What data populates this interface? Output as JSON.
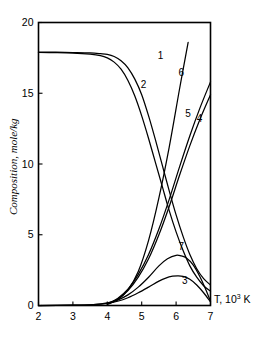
{
  "chart_data": {
    "type": "line",
    "title": "",
    "xlabel": "T, 10^3 K",
    "xlabel_main": "T, 10",
    "xlabel_sup": "3",
    "xlabel_tail": " K",
    "ylabel": "Composition, mole/kg",
    "xlim": [
      2,
      7
    ],
    "ylim": [
      0,
      20
    ],
    "xticks": [
      "2",
      "3",
      "4",
      "5",
      "6",
      "7"
    ],
    "xtick_values": [
      2,
      3,
      4,
      5,
      6,
      7
    ],
    "yticks": [
      "0",
      "5",
      "10",
      "15",
      "20"
    ],
    "ytick_values": [
      0,
      5,
      10,
      15,
      20
    ],
    "grid": false,
    "legend": "inline-curve-numbers",
    "line_color": "#000000",
    "background": "#ffffff",
    "series": [
      {
        "name": "1",
        "label": "1",
        "label_x": 5.55,
        "label_y": 17.45,
        "x": [
          2.0,
          2.5,
          3.0,
          3.5,
          3.8,
          4.0,
          4.2,
          4.4,
          4.6,
          4.8,
          5.0,
          5.2,
          5.4,
          5.6,
          5.8,
          6.0,
          6.2,
          6.4,
          6.6,
          6.8,
          7.0
        ],
        "y": [
          17.9,
          17.9,
          17.88,
          17.85,
          17.8,
          17.75,
          17.6,
          17.3,
          16.8,
          16.0,
          14.9,
          13.4,
          11.7,
          9.9,
          8.1,
          6.4,
          4.9,
          3.6,
          2.6,
          1.9,
          1.45
        ]
      },
      {
        "name": "2",
        "label": "2",
        "label_x": 5.05,
        "label_y": 15.35,
        "x": [
          2.0,
          2.5,
          3.0,
          3.5,
          3.8,
          4.0,
          4.2,
          4.4,
          4.6,
          4.8,
          5.0,
          5.2,
          5.4,
          5.6,
          5.8,
          6.0,
          6.2,
          6.4,
          6.6,
          6.8,
          7.0
        ],
        "y": [
          17.88,
          17.87,
          17.84,
          17.76,
          17.66,
          17.5,
          17.2,
          16.7,
          15.9,
          14.8,
          13.4,
          11.8,
          10.1,
          8.4,
          6.7,
          5.2,
          3.9,
          2.8,
          2.0,
          1.4,
          1.0
        ]
      },
      {
        "name": "3",
        "label": "3",
        "label_x": 6.25,
        "label_y": 1.55,
        "x": [
          2.0,
          3.0,
          3.6,
          4.0,
          4.3,
          4.6,
          4.9,
          5.2,
          5.5,
          5.7,
          5.9,
          6.05,
          6.2,
          6.4,
          6.6,
          6.8,
          7.0
        ],
        "y": [
          0.0,
          0.02,
          0.06,
          0.15,
          0.3,
          0.55,
          0.9,
          1.3,
          1.72,
          1.94,
          2.07,
          2.1,
          2.06,
          1.85,
          1.45,
          0.9,
          0.25
        ]
      },
      {
        "name": "4",
        "label": "4",
        "label_x": 6.68,
        "label_y": 13.0,
        "x": [
          4.0,
          4.3,
          4.6,
          4.9,
          5.2,
          5.5,
          5.8,
          6.1,
          6.4,
          6.7,
          7.0
        ],
        "y": [
          0.1,
          0.45,
          1.05,
          2.0,
          3.3,
          5.0,
          7.0,
          9.2,
          11.3,
          13.2,
          14.9
        ]
      },
      {
        "name": "5",
        "label": "5",
        "label_x": 6.35,
        "label_y": 13.3,
        "x": [
          4.0,
          4.3,
          4.6,
          4.9,
          5.2,
          5.5,
          5.8,
          6.1,
          6.4,
          6.7,
          7.0
        ],
        "y": [
          0.12,
          0.5,
          1.15,
          2.2,
          3.6,
          5.4,
          7.5,
          9.8,
          12.0,
          14.0,
          15.8
        ]
      },
      {
        "name": "6",
        "label": "6",
        "label_x": 6.15,
        "label_y": 16.25,
        "x": [
          4.0,
          4.3,
          4.6,
          4.9,
          5.2,
          5.5,
          5.8,
          6.1,
          6.35
        ],
        "y": [
          0.08,
          0.4,
          1.1,
          2.4,
          4.6,
          7.6,
          11.2,
          15.3,
          18.6
        ]
      },
      {
        "name": "7",
        "label": "7",
        "label_x": 6.15,
        "label_y": 3.95,
        "x": [
          2.0,
          3.0,
          3.6,
          4.0,
          4.3,
          4.6,
          4.9,
          5.2,
          5.5,
          5.75,
          6.0,
          6.15,
          6.3,
          6.5,
          6.7,
          6.85,
          7.0
        ],
        "y": [
          0.0,
          0.02,
          0.07,
          0.18,
          0.38,
          0.75,
          1.3,
          2.0,
          2.8,
          3.3,
          3.55,
          3.5,
          3.35,
          2.85,
          2.0,
          1.2,
          0.3
        ]
      }
    ]
  }
}
